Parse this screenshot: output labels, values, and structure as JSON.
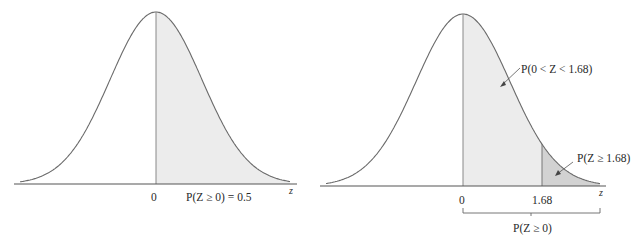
{
  "left_panel": {
    "axis_label": "z",
    "tick_zero": "0",
    "prob_label": "P(Z ≥ 0) = 0.5"
  },
  "right_panel": {
    "axis_label": "z",
    "tick_zero": "0",
    "tick_168": "1.68",
    "middle_region_label": "P(0 < Z < 1.68)",
    "tail_region_label": "P(Z ≥ 1.68)",
    "bracket_label": "P(Z ≥ 0)"
  },
  "colors": {
    "curve": "#6a6a6a",
    "light_shade": "#ececec",
    "dark_shade": "#d2d2d2",
    "axis": "#555555"
  }
}
